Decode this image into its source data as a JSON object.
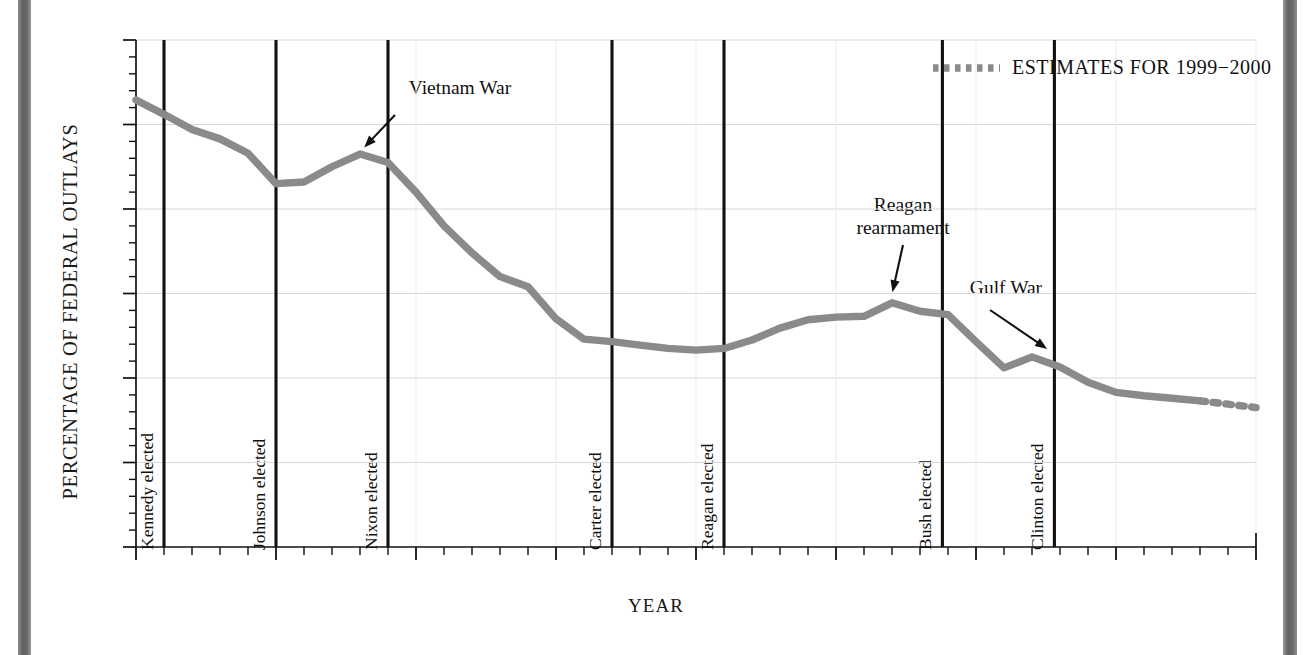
{
  "chart_data": {
    "type": "line",
    "title": "",
    "xlabel": "YEAR",
    "ylabel": "PERCENTAGE OF FEDERAL OUTLAYS",
    "xlim": [
      1960,
      2000
    ],
    "ylim": [
      0,
      60
    ],
    "grid": true,
    "y_ticks": [
      "0",
      "10",
      "20",
      "30",
      "40",
      "50",
      "60"
    ],
    "y_tick_values": [
      0,
      10,
      20,
      30,
      40,
      50,
      60
    ],
    "x_ticks": [
      "1960",
      "'65",
      "'70",
      "'75",
      "'80",
      "'85",
      "'90",
      "'95",
      "'00"
    ],
    "x_tick_values": [
      1960,
      1965,
      1970,
      1975,
      1980,
      1985,
      1990,
      1995,
      2000
    ],
    "minor_x_tick_interval": 1,
    "line_color": "#8a8a8a",
    "series": [
      {
        "name": "Defense share of federal outlays",
        "style": "solid",
        "x": [
          1960,
          1961,
          1962,
          1963,
          1964,
          1965,
          1966,
          1967,
          1968,
          1969,
          1970,
          1971,
          1972,
          1973,
          1974,
          1975,
          1976,
          1977,
          1978,
          1979,
          1980,
          1981,
          1982,
          1983,
          1984,
          1985,
          1986,
          1987,
          1988,
          1989,
          1990,
          1991,
          1992,
          1993,
          1994,
          1995,
          1996,
          1997,
          1998
        ],
        "values": [
          52.9,
          51.2,
          49.4,
          48.3,
          46.6,
          43.0,
          43.2,
          45.0,
          46.5,
          45.5,
          42.0,
          38.0,
          34.8,
          32.0,
          30.8,
          27.0,
          24.6,
          24.3,
          23.9,
          23.5,
          23.3,
          23.5,
          24.5,
          25.9,
          26.9,
          27.2,
          27.3,
          28.9,
          27.9,
          27.5,
          24.3,
          21.2,
          22.5,
          21.3,
          19.5,
          18.3,
          17.9,
          17.6,
          17.3
        ]
      },
      {
        "name": "ESTIMATES FOR 1999−2000",
        "style": "dotted",
        "x": [
          1998,
          1999,
          2000
        ],
        "values": [
          17.3,
          16.9,
          16.5
        ]
      }
    ],
    "legend": {
      "position": "top-right",
      "entries": [
        {
          "label": "ESTIMATES FOR 1999−2000",
          "style": "dotted",
          "color": "#8a8a8a"
        }
      ]
    },
    "event_lines": [
      {
        "label": "Kennedy elected",
        "year": 1961
      },
      {
        "label": "Johnson elected",
        "year": 1965
      },
      {
        "label": "Nixon elected",
        "year": 1969
      },
      {
        "label": "Carter elected",
        "year": 1977
      },
      {
        "label": "Reagan elected",
        "year": 1981
      },
      {
        "label": "Bush elected",
        "year": 1988.8
      },
      {
        "label": "Clinton elected",
        "year": 1992.8
      }
    ],
    "annotations": [
      {
        "label": "Vietnam War",
        "point_year": 1968.1,
        "point_value": 46.4
      },
      {
        "label": "Reagan rearmament",
        "point_year": 1987.0,
        "point_value": 29.2
      },
      {
        "label": "Gulf War",
        "point_year": 1992.6,
        "point_value": 22.6
      }
    ]
  }
}
